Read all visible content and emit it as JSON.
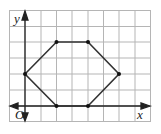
{
  "diagram": {
    "type": "coordinate-plane-polygon",
    "axes": {
      "x_label": "x",
      "y_label": "y",
      "origin_label": "O"
    },
    "grid": {
      "cols": 9,
      "rows": 7,
      "x_min": -1,
      "x_max": 8,
      "y_min": -1,
      "y_max": 6
    },
    "polygon": {
      "shape": "hexagon",
      "vertices": [
        [
          0,
          2
        ],
        [
          2,
          4
        ],
        [
          4,
          4
        ],
        [
          6,
          2
        ],
        [
          4,
          0
        ],
        [
          2,
          0
        ]
      ]
    },
    "colors": {
      "grid": "#b0b0b0",
      "axis": "#222222",
      "polygon": "#333333"
    }
  }
}
